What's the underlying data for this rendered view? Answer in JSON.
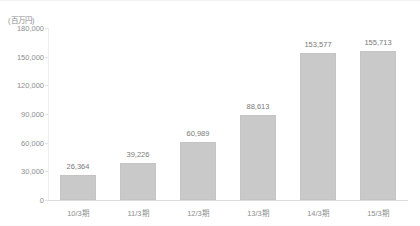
{
  "chart_data": {
    "type": "bar",
    "title": "",
    "subtitle": "",
    "unit_label": "(百万円)",
    "xlabel": "",
    "ylabel": "",
    "categories": [
      "10/3期",
      "11/3期",
      "12/3期",
      "13/3期",
      "14/3期",
      "15/3期"
    ],
    "values": [
      26364,
      39226,
      60989,
      88613,
      153577,
      155713
    ],
    "value_labels": [
      "26,364",
      "39,226",
      "60,989",
      "88,613",
      "153,577",
      "155,713"
    ],
    "ylim": [
      0,
      180000
    ],
    "yticks": [
      0,
      30000,
      60000,
      90000,
      120000,
      150000,
      180000
    ],
    "ytick_labels": [
      "0",
      "30,000",
      "60,000",
      "90,000",
      "120,000",
      "150,000",
      "180,000"
    ],
    "grid": false,
    "legend": false,
    "legend_position": "none",
    "series": [
      {
        "name": "",
        "values": [
          26364,
          39226,
          60989,
          88613,
          153577,
          155713
        ],
        "color": "#c9c9c9"
      }
    ]
  },
  "colors": {
    "bar_fill": "#c9c9c9",
    "bar_border": "#c4c4c4",
    "axis": "#dcdcdc",
    "tick_text": "#8d8d8d",
    "value_text": "#7a7a7a",
    "background": "#ffffff"
  }
}
